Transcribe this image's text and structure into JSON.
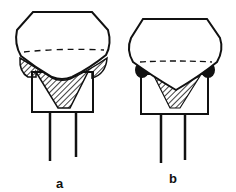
{
  "figure": {
    "panels": [
      {
        "id": "a",
        "label": "a",
        "description": "Joint with hatched fillet material extending beyond body edges"
      },
      {
        "id": "b",
        "label": "b",
        "description": "Joint with small solid bead at body edges"
      }
    ],
    "colors": {
      "line": "#111111",
      "fill": "#ffffff",
      "solid": "#111111"
    }
  }
}
